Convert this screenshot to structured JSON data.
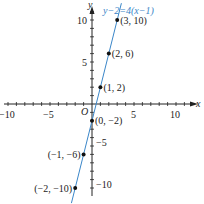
{
  "chart_data": {
    "type": "line",
    "title": "",
    "equation_label": "y−2=4(x−1)",
    "xlabel": "x",
    "ylabel": "y",
    "origin_label": "O",
    "xlim": [
      -10.5,
      12
    ],
    "ylim": [
      -11.5,
      12
    ],
    "grid": false,
    "x_tick_labels": [
      "−10",
      "−5",
      "5",
      "10"
    ],
    "y_tick_labels": [
      "10",
      "5",
      "−5",
      "−10"
    ],
    "line": {
      "slope": 4,
      "intercept": -2,
      "color": "#3a86c8"
    },
    "points": [
      {
        "x": 3,
        "y": 10,
        "label": "(3, 10)"
      },
      {
        "x": 2,
        "y": 6,
        "label": "(2, 6)"
      },
      {
        "x": 1,
        "y": 2,
        "label": "(1, 2)"
      },
      {
        "x": 0,
        "y": -2,
        "label": "(0, −2)"
      },
      {
        "x": -1,
        "y": -6,
        "label": "(−1, −6)"
      },
      {
        "x": -2,
        "y": -10,
        "label": "(−2, −10)"
      }
    ]
  }
}
